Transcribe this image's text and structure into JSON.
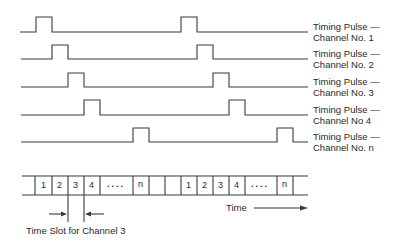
{
  "diagram": {
    "channels": [
      {
        "id": "1",
        "label_line1": "Timing Pulse —",
        "label_line2": "Channel No. 1",
        "baseline_y": 32,
        "pulses_x": [
          36,
          181
        ]
      },
      {
        "id": "2",
        "label_line1": "Timing Pulse —",
        "label_line2": "Channel No. 2",
        "baseline_y": 59,
        "pulses_x": [
          52,
          197
        ]
      },
      {
        "id": "3",
        "label_line1": "Timing Pulse —",
        "label_line2": "Channel No. 3",
        "baseline_y": 87,
        "pulses_x": [
          68,
          213
        ]
      },
      {
        "id": "4",
        "label_line1": "Timing Pulse —",
        "label_line2": "Channel No 4",
        "baseline_y": 115,
        "pulses_x": [
          84,
          229
        ]
      },
      {
        "id": "n",
        "label_line1": "Timing Pulse —",
        "label_line2": "Channel No. n",
        "baseline_y": 142,
        "pulses_x": [
          133,
          277
        ]
      }
    ],
    "slot_strip": {
      "slots": [
        "",
        "1",
        "2",
        "3",
        "4",
        "....",
        "n",
        "",
        "",
        "1",
        "2",
        "3",
        "4",
        "....",
        "n",
        ""
      ],
      "time_label": "Time",
      "slot_annotation": "Time Slot for Channel 3"
    },
    "colors": {
      "line": "#3a3a3a",
      "text": "#2a2a2a",
      "background": "#ffffff"
    }
  }
}
